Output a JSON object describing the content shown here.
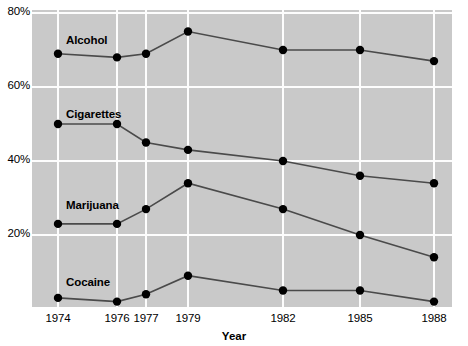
{
  "chart_data": {
    "type": "line",
    "title": "",
    "xlabel": "Year",
    "ylabel": "",
    "categories": [
      "1974",
      "1976",
      "1977",
      "1979",
      "1982",
      "1985",
      "1988"
    ],
    "x": [
      1974,
      1976,
      1977,
      1979,
      1982,
      1985,
      1988
    ],
    "xlim": [
      1974,
      1988
    ],
    "ylim": [
      0,
      80
    ],
    "yticks": [
      "20%",
      "40%",
      "60%",
      "80%"
    ],
    "ytick_values": [
      20,
      40,
      60,
      80
    ],
    "grid": true,
    "legend": "inline-labels",
    "series": [
      {
        "name": "Alcohol",
        "values": [
          69,
          68,
          69,
          75,
          70,
          70,
          67
        ]
      },
      {
        "name": "Cigarettes",
        "values": [
          50,
          50,
          45,
          43,
          40,
          36,
          34
        ]
      },
      {
        "name": "Marijuana",
        "values": [
          23,
          23,
          27,
          34,
          27,
          20,
          14
        ]
      },
      {
        "name": "Cocaine",
        "values": [
          3,
          2,
          4,
          9,
          5,
          5,
          2
        ]
      }
    ],
    "colors": {
      "plot_background": "#c9c9c9",
      "gridline": "#fdfdfd",
      "line": "#4a4a4a",
      "marker": "#000000",
      "text": "#000000",
      "page_background": "#ffffff"
    }
  },
  "axes": {
    "y_tick_labels": [
      "80%",
      "60%",
      "40%",
      "20%"
    ],
    "x_tick_labels": [
      "1974",
      "1976",
      "1977",
      "1979",
      "1982",
      "1985",
      "1988"
    ],
    "x_axis_title": "Year"
  },
  "series_labels": {
    "alcohol": "Alcohol",
    "cigarettes": "Cigarettes",
    "marijuana": "Marijuana",
    "cocaine": "Cocaine"
  }
}
